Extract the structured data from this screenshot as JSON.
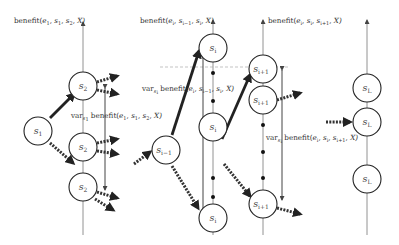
{
  "figure": {
    "columns": [
      {
        "id": "col-2",
        "axis_label": {
          "base": "benefit(e",
          "args": [
            "1",
            ", s",
            "1",
            ", s",
            "2",
            ", X)"
          ]
        },
        "nodes": [
          {
            "sym": "s",
            "sub": "2"
          },
          {
            "sym": "s",
            "sub": "2"
          },
          {
            "sym": "s",
            "sub": "2"
          }
        ],
        "var_label": "var_s1 benefit(e1, s1, s2, X)"
      },
      {
        "id": "col-i",
        "axis_label": "benefit(e_i, s_i-1, s_i, X)",
        "nodes": [
          {
            "sym": "s",
            "sub": "i"
          },
          {
            "sym": "s",
            "sub": "i"
          },
          {
            "sym": "s",
            "sub": "i"
          }
        ],
        "var_label": "var_si benefit(e_i, s_i-1, s_i, X)"
      },
      {
        "id": "col-i+1",
        "axis_label": "benefit(e_i, s_i, s_i+1, X)",
        "nodes": [
          {
            "sym": "s",
            "sub": "i+1"
          },
          {
            "sym": "s",
            "sub": "i+1"
          },
          {
            "sym": "s",
            "sub": "i+1"
          }
        ],
        "var_label": "var_si benefit(e_i, s_i, s_i+1, X)"
      },
      {
        "id": "col-L",
        "nodes": [
          {
            "sym": "s",
            "sub": "L"
          },
          {
            "sym": "s",
            "sub": "L"
          },
          {
            "sym": "s",
            "sub": "L"
          }
        ]
      }
    ],
    "source_nodes": [
      {
        "sym": "s",
        "sub": "1"
      },
      {
        "sym": "s",
        "sub": "i−1"
      }
    ],
    "text": {
      "benefit": "benefit(",
      "var": "var",
      "e": "e",
      "s": "s",
      "X": "X)",
      "sub_1": "1",
      "sub_2": "2",
      "sub_i": "i",
      "sub_im1": "i−1",
      "sub_ip1": "i+1",
      "sub_L": "L",
      "sub_s1": "s",
      "sub_s1b": "1",
      "sub_si": "s",
      "sub_sib": "i",
      "comma": ", "
    }
  }
}
